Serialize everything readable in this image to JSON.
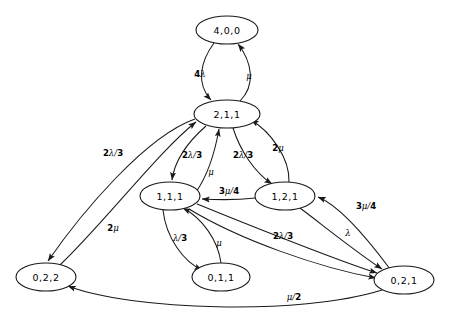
{
  "diagram": {
    "type": "state-transition-graph",
    "nodes": [
      {
        "id": "n400",
        "label": "4,0,0",
        "cx": 227,
        "cy": 30,
        "rx": 31,
        "ry": 14
      },
      {
        "id": "n211",
        "label": "2,1,1",
        "cx": 227,
        "cy": 114,
        "rx": 33,
        "ry": 14
      },
      {
        "id": "n111",
        "label": "1,1,1",
        "cx": 170,
        "cy": 196,
        "rx": 30,
        "ry": 14
      },
      {
        "id": "n121",
        "label": "1,2,1",
        "cx": 285,
        "cy": 196,
        "rx": 30,
        "ry": 14
      },
      {
        "id": "n022",
        "label": "0,2,2",
        "cx": 46,
        "cy": 277,
        "rx": 30,
        "ry": 14
      },
      {
        "id": "n011",
        "label": "0,1,1",
        "cx": 221,
        "cy": 277,
        "rx": 29,
        "ry": 14
      },
      {
        "id": "n021",
        "label": "0,2,1",
        "cx": 404,
        "cy": 280,
        "rx": 30,
        "ry": 14
      }
    ],
    "edges": [
      {
        "id": "e1",
        "from": "4,0,0",
        "to": "2,1,1",
        "label": "4λ",
        "coef": "4",
        "greek": "λ",
        "denom": "",
        "lx": 200,
        "ly": 74
      },
      {
        "id": "e2",
        "from": "2,1,1",
        "to": "4,0,0",
        "label": "μ",
        "coef": "",
        "greek": "μ",
        "denom": "",
        "lx": 248,
        "ly": 76
      },
      {
        "id": "e3",
        "from": "2,1,1",
        "to": "0,2,2",
        "label": "2λ/3",
        "coef": "2",
        "greek": "λ",
        "denom": "3",
        "lx": 113,
        "ly": 153
      },
      {
        "id": "e4",
        "from": "0,2,2",
        "to": "2,1,1",
        "label": "2μ",
        "coef": "2",
        "greek": "μ",
        "denom": "",
        "lx": 113,
        "ly": 228
      },
      {
        "id": "e5",
        "from": "2,1,1",
        "to": "1,1,1",
        "label": "2λ/3",
        "coef": "2",
        "greek": "λ",
        "denom": "3",
        "lx": 192,
        "ly": 155
      },
      {
        "id": "e6",
        "from": "1,1,1",
        "to": "2,1,1",
        "label": "μ",
        "coef": "",
        "greek": "μ",
        "denom": "",
        "lx": 210,
        "ly": 171
      },
      {
        "id": "e7",
        "from": "2,1,1",
        "to": "1,2,1",
        "label": "2λ/3",
        "coef": "2",
        "greek": "λ",
        "denom": "3",
        "lx": 243,
        "ly": 155
      },
      {
        "id": "e8",
        "from": "1,2,1",
        "to": "2,1,1",
        "label": "2μ",
        "coef": "2",
        "greek": "μ",
        "denom": "",
        "lx": 277,
        "ly": 148
      },
      {
        "id": "e9",
        "from": "1,2,1",
        "to": "1,1,1",
        "label": "3μ/4",
        "coef": "3",
        "greek": "μ",
        "denom": "4",
        "lx": 229,
        "ly": 192
      },
      {
        "id": "e10",
        "from": "0,2,1",
        "to": "1,2,1",
        "label": "3μ/4",
        "coef": "3",
        "greek": "μ",
        "denom": "4",
        "lx": 366,
        "ly": 206
      },
      {
        "id": "e11",
        "from": "1,2,1",
        "to": "0,2,1",
        "label": "λ",
        "coef": "",
        "greek": "λ",
        "denom": "",
        "lx": 348,
        "ly": 234
      },
      {
        "id": "e12",
        "from": "1,1,1",
        "to": "0,2,1",
        "label": "2λ/3",
        "coef": "2",
        "greek": "λ",
        "denom": "3",
        "lx": 283,
        "ly": 237
      },
      {
        "id": "e13",
        "from": "1,1,1",
        "to": "0,1,1",
        "label": "λ/3",
        "coef": "",
        "greek": "λ",
        "denom": "3",
        "lx": 180,
        "ly": 238
      },
      {
        "id": "e14",
        "from": "0,1,1",
        "to": "1,1,1",
        "label": "μ",
        "coef": "",
        "greek": "μ",
        "denom": "",
        "lx": 218,
        "ly": 243
      },
      {
        "id": "e15",
        "from": "0,2,1",
        "to": "0,2,2",
        "label": "μ/2",
        "coef": "",
        "greek": "μ",
        "denom": "2",
        "lx": 294,
        "ly": 297
      }
    ]
  }
}
